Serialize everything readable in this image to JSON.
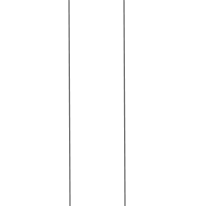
{
  "canvas": {
    "width": 205,
    "height": 207,
    "background": "#ffffff"
  },
  "lines": [
    {
      "id": "left-line",
      "x1": 69,
      "y1": 0,
      "x2": 70,
      "y2": 206,
      "color": "#6e6e6e",
      "width": 1.3
    },
    {
      "id": "right-line",
      "x1": 124,
      "y1": 0,
      "x2": 125,
      "y2": 206,
      "color": "#6e6e6e",
      "width": 1.3
    }
  ]
}
